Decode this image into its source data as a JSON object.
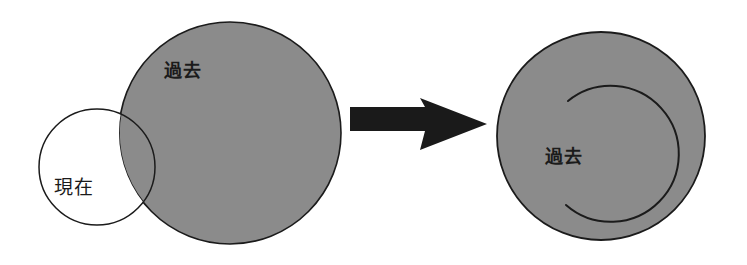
{
  "figure": {
    "type": "set-diagram",
    "background_color": "#ffffff"
  },
  "palette": {
    "fill_gray": "#8b8b8b",
    "stroke_black": "#1b1b1b",
    "arrow_black": "#1a1a1a",
    "white": "#ffffff"
  },
  "left_panel": {
    "name": "before-state",
    "past_circle": {
      "label": "過去",
      "fill": "#8b8b8b",
      "cx": 230,
      "cy": 133,
      "r": 111,
      "label_x": 164,
      "label_y": 77
    },
    "present_circle": {
      "label": "現在",
      "fill": "#ffffff",
      "cx": 97,
      "cy": 167,
      "r": 58,
      "label_x": 54,
      "label_y": 194
    }
  },
  "arrow": {
    "name": "transformation-arrow",
    "direction": "right",
    "color": "#1a1a1a",
    "x_start": 350,
    "x_end": 487,
    "y_center": 124
  },
  "right_panel": {
    "name": "after-state",
    "past_circle": {
      "label": "過去",
      "fill": "#8b8b8b",
      "cx": 601,
      "cy": 136,
      "r": 104,
      "label_x": 545,
      "label_y": 163
    },
    "inner_arc": {
      "cx": 622,
      "cy": 157,
      "r": 68,
      "gap_side": "left",
      "stroke": "#1b1b1b"
    }
  },
  "labels": {
    "past": "過去",
    "present": "現在"
  }
}
